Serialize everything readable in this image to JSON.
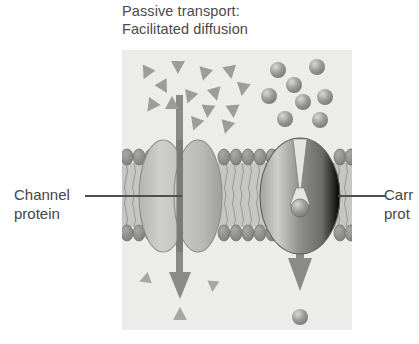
{
  "figure": {
    "title_line1": "Passive transport:",
    "title_line2": "Facilitated diffusion",
    "labels": {
      "channel_line1": "Channel",
      "channel_line2": "protein",
      "carrier_line1": "Carr",
      "carrier_line2": "prot"
    },
    "colors": {
      "panel_background": "#ececea",
      "page_background": "#ffffff",
      "text": "#454545",
      "leader_line": "#4f4f4f",
      "membrane_head": "#8d8d8d",
      "membrane_tail": "#b5b5b3",
      "channel_protein_light": "#c9c9c7",
      "channel_protein_dark": "#a9a9a7",
      "carrier_protein_light": "#b9b9b7",
      "carrier_protein_dark": "#6e6e6e",
      "arrow": "#8a8a8a",
      "triangle_particle": "#9a9a98",
      "sphere_particle": "#8f8f8d"
    },
    "panel": {
      "x": 122,
      "y": 50,
      "width": 230,
      "height": 280
    },
    "membrane": {
      "top": 150,
      "bottom": 240,
      "description": "phospholipid bilayer with oval head groups and wavy tails"
    },
    "proteins": [
      {
        "name": "channel-protein",
        "type": "channel",
        "center_x": 180,
        "center_y": 196,
        "description": "two lobes separated by a vertical pore"
      },
      {
        "name": "carrier-protein",
        "type": "carrier",
        "center_x": 300,
        "center_y": 196,
        "description": "oval protein with funnel-shaped binding site holding a solute sphere"
      }
    ],
    "arrows": [
      {
        "name": "channel-transport-arrow",
        "x": 180,
        "from_y": 95,
        "to_y": 300,
        "direction": "down"
      },
      {
        "name": "carrier-transport-arrow",
        "x": 300,
        "from_y": 150,
        "to_y": 292,
        "direction": "down"
      }
    ],
    "particles": {
      "triangles_above": [
        {
          "x": 147,
          "y": 72,
          "r": 205
        },
        {
          "x": 178,
          "y": 66,
          "r": 180
        },
        {
          "x": 205,
          "y": 73,
          "r": 195
        },
        {
          "x": 230,
          "y": 71,
          "r": 170
        },
        {
          "x": 163,
          "y": 86,
          "r": 150
        },
        {
          "x": 190,
          "y": 96,
          "r": 200
        },
        {
          "x": 215,
          "y": 93,
          "r": 165
        },
        {
          "x": 243,
          "y": 88,
          "r": 190
        },
        {
          "x": 152,
          "y": 105,
          "r": 215
        },
        {
          "x": 172,
          "y": 104,
          "r": 0
        },
        {
          "x": 208,
          "y": 110,
          "r": 185
        },
        {
          "x": 233,
          "y": 110,
          "r": 175
        },
        {
          "x": 196,
          "y": 123,
          "r": 200
        },
        {
          "x": 227,
          "y": 126,
          "r": 195
        }
      ],
      "triangles_below": [
        {
          "x": 146,
          "y": 279,
          "r": 250
        },
        {
          "x": 213,
          "y": 285,
          "r": 185
        },
        {
          "x": 180,
          "y": 315,
          "r": 0
        }
      ],
      "spheres_above": [
        {
          "x": 278,
          "y": 70
        },
        {
          "x": 317,
          "y": 67
        },
        {
          "x": 294,
          "y": 85
        },
        {
          "x": 269,
          "y": 96
        },
        {
          "x": 303,
          "y": 102
        },
        {
          "x": 325,
          "y": 97
        },
        {
          "x": 285,
          "y": 119
        },
        {
          "x": 320,
          "y": 120
        }
      ],
      "spheres_below": [
        {
          "x": 300,
          "y": 317
        }
      ]
    }
  }
}
